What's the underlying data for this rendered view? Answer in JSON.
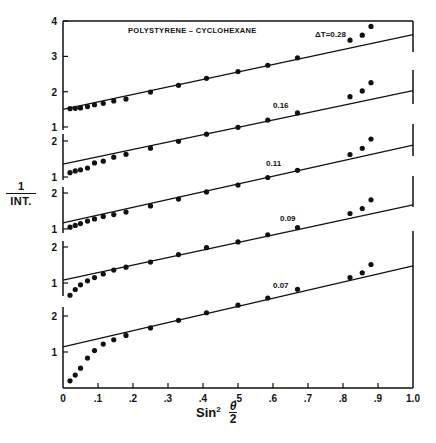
{
  "chart_data": {
    "type": "scatter",
    "title": "POLYSTYRENE – CYCLOHEXANE",
    "xlabel": "Sin² θ/2",
    "ylabel": "1 / INT.",
    "xlim": [
      0,
      1.0
    ],
    "x_ticks": [
      "0",
      ".1",
      ".2",
      ".3",
      ".4",
      ".5",
      ".6",
      ".7",
      ".8",
      ".9",
      "1.0"
    ],
    "grid": false,
    "layout": "five vertically stacked panels with offset y-axes sharing one x-axis",
    "series": [
      {
        "name": "ΔT = 0.28",
        "label": "ΔT=0.28",
        "ylim": [
          1,
          4
        ],
        "y_ticks": [
          1,
          2,
          3,
          4
        ],
        "fit_line": {
          "intercept": 1.5,
          "value_at_1": 3.62
        },
        "x": [
          0.02,
          0.035,
          0.05,
          0.07,
          0.09,
          0.115,
          0.145,
          0.18,
          0.25,
          0.33,
          0.41,
          0.5,
          0.585,
          0.67,
          0.82,
          0.855,
          0.88
        ],
        "y": [
          1.52,
          1.53,
          1.54,
          1.58,
          1.63,
          1.67,
          1.74,
          1.79,
          1.99,
          2.18,
          2.38,
          2.57,
          2.75,
          2.96,
          3.46,
          3.6,
          3.85
        ]
      },
      {
        "name": "ΔT = 0.16",
        "label": "0.16",
        "ylim": [
          1,
          2.2
        ],
        "y_ticks": [
          1,
          2
        ],
        "fit_line": {
          "intercept": 1.36,
          "value_at_1": 3.4
        },
        "x": [
          0.02,
          0.035,
          0.05,
          0.07,
          0.09,
          0.115,
          0.145,
          0.18,
          0.25,
          0.33,
          0.41,
          0.5,
          0.585,
          0.67,
          0.82,
          0.855,
          0.88
        ],
        "y": [
          1.12,
          1.17,
          1.2,
          1.25,
          1.39,
          1.44,
          1.55,
          1.63,
          1.8,
          1.99,
          2.19,
          2.38,
          2.58,
          2.78,
          3.23,
          3.39,
          3.62
        ]
      },
      {
        "name": "ΔT = 0.11",
        "label": "0.11",
        "ylim": [
          1,
          2.2
        ],
        "y_ticks": [
          1,
          2
        ],
        "fit_line": {
          "intercept": 1.17,
          "value_at_1": 3.33
        },
        "x": [
          0.02,
          0.035,
          0.05,
          0.07,
          0.09,
          0.115,
          0.145,
          0.18,
          0.25,
          0.33,
          0.41,
          0.5,
          0.585,
          0.67,
          0.82,
          0.855,
          0.88
        ],
        "y": [
          1.05,
          1.1,
          1.15,
          1.22,
          1.28,
          1.35,
          1.4,
          1.47,
          1.64,
          1.83,
          2.03,
          2.22,
          2.43,
          2.63,
          3.07,
          3.24,
          3.5
        ]
      },
      {
        "name": "ΔT = 0.09",
        "label": "0.09",
        "ylim": [
          0.6,
          2.2
        ],
        "y_ticks": [
          1,
          2
        ],
        "fit_line": {
          "intercept": 1.08,
          "value_at_1": 3.17
        },
        "x": [
          0.02,
          0.035,
          0.05,
          0.07,
          0.09,
          0.115,
          0.145,
          0.18,
          0.25,
          0.33,
          0.41,
          0.5,
          0.585,
          0.67,
          0.82,
          0.855,
          0.88
        ],
        "y": [
          0.66,
          0.82,
          0.95,
          1.06,
          1.15,
          1.25,
          1.36,
          1.44,
          1.58,
          1.79,
          1.98,
          2.14,
          2.34,
          2.54,
          2.93,
          3.07,
          3.31
        ]
      },
      {
        "name": "ΔT = 0.07",
        "label": "0.07",
        "ylim": [
          0,
          2.3
        ],
        "y_ticks": [
          1,
          2
        ],
        "fit_line": {
          "intercept": 1.14,
          "value_at_1": 3.39
        },
        "x": [
          0.02,
          0.035,
          0.05,
          0.07,
          0.09,
          0.115,
          0.145,
          0.18,
          0.25,
          0.33,
          0.41,
          0.5,
          0.585,
          0.67,
          0.82,
          0.855,
          0.88
        ],
        "y": [
          0.2,
          0.36,
          0.55,
          0.83,
          1.04,
          1.22,
          1.34,
          1.46,
          1.67,
          1.88,
          2.09,
          2.3,
          2.5,
          2.74,
          3.07,
          3.2,
          3.43
        ]
      }
    ]
  },
  "layout": {
    "x0_px": 63,
    "x1_px": 413,
    "panels_px": [
      {
        "unit_px": 35.3,
        "y1_px": 127,
        "axis_top_px": 21,
        "axis_bottom_px": 130,
        "label_x": 0.72,
        "label_dy": -18
      },
      {
        "unit_px": 36,
        "y1_px": 177,
        "axis_top_px": 134,
        "axis_bottom_px": 180,
        "label_x": 0.6,
        "label_dy": -12
      },
      {
        "unit_px": 36,
        "y1_px": 229,
        "axis_top_px": 187,
        "axis_bottom_px": 233,
        "label_x": 0.58,
        "label_dy": -12
      },
      {
        "unit_px": 36,
        "y1_px": 283,
        "axis_top_px": 241,
        "axis_bottom_px": 296,
        "label_x": 0.62,
        "label_dy": -12
      },
      {
        "unit_px": 36,
        "y1_px": 352,
        "axis_top_px": 307,
        "axis_bottom_px": 388,
        "label_x": 0.6,
        "label_dy": -10
      }
    ],
    "right_segments_px": [
      [
        21,
        52
      ],
      [
        70,
        104
      ],
      [
        124,
        156
      ],
      [
        176,
        207
      ],
      [
        231,
        388
      ]
    ],
    "x_axis_y_px": 388,
    "title_pos": [
      128,
      33
    ],
    "colors": {
      "ink": "#111111",
      "background": "#ffffff"
    }
  },
  "labels": {
    "ylabel_num": "1",
    "ylabel_den": "INT.",
    "xlabel_main": "Sin",
    "xlabel_sup": "2",
    "xlabel_frac_num": "θ",
    "xlabel_frac_den": "2"
  }
}
